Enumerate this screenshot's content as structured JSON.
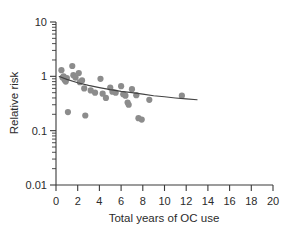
{
  "chart_data": {
    "type": "scatter",
    "title": "",
    "xlabel": "Total years of OC use",
    "ylabel": "Relative risk",
    "xlim": [
      0,
      20
    ],
    "ylim": [
      0.01,
      10
    ],
    "yscale": "log",
    "xscale": "linear",
    "grid": false,
    "legend": null,
    "xticks": [
      0,
      2,
      4,
      6,
      8,
      10,
      12,
      14,
      16,
      18,
      20
    ],
    "xticklabels": [
      "0",
      "2",
      "4",
      "6",
      "8",
      "10",
      "12",
      "14",
      "16",
      "18",
      "20"
    ],
    "yticks": [
      0.01,
      0.1,
      1,
      10
    ],
    "yticklabels": [
      "0.01",
      "0.1",
      "1",
      "10"
    ],
    "yminorticks": [
      0.02,
      0.03,
      0.04,
      0.05,
      0.06,
      0.07,
      0.08,
      0.09,
      0.2,
      0.3,
      0.4,
      0.5,
      0.6,
      0.7,
      0.8,
      0.9,
      2,
      3,
      4,
      5,
      6,
      7,
      8,
      9
    ],
    "marker": "circle",
    "marker_color": "#8c8c8c",
    "marker_size": 3.1,
    "points": [
      {
        "x": 0.5,
        "y": 1.3
      },
      {
        "x": 0.6,
        "y": 0.95
      },
      {
        "x": 0.7,
        "y": 1.0
      },
      {
        "x": 0.8,
        "y": 0.86
      },
      {
        "x": 0.9,
        "y": 0.8
      },
      {
        "x": 1.0,
        "y": 0.93
      },
      {
        "x": 1.1,
        "y": 0.22
      },
      {
        "x": 1.5,
        "y": 1.55
      },
      {
        "x": 1.6,
        "y": 1.05
      },
      {
        "x": 1.8,
        "y": 0.95
      },
      {
        "x": 2.1,
        "y": 1.15
      },
      {
        "x": 2.2,
        "y": 0.78
      },
      {
        "x": 2.4,
        "y": 0.84
      },
      {
        "x": 2.6,
        "y": 0.6
      },
      {
        "x": 2.7,
        "y": 0.19
      },
      {
        "x": 3.2,
        "y": 0.55
      },
      {
        "x": 3.6,
        "y": 0.5
      },
      {
        "x": 4.1,
        "y": 0.9
      },
      {
        "x": 4.3,
        "y": 0.48
      },
      {
        "x": 4.6,
        "y": 0.4
      },
      {
        "x": 5.0,
        "y": 0.62
      },
      {
        "x": 5.2,
        "y": 0.52
      },
      {
        "x": 5.5,
        "y": 0.5
      },
      {
        "x": 6.0,
        "y": 0.66
      },
      {
        "x": 6.2,
        "y": 0.47
      },
      {
        "x": 6.4,
        "y": 0.44
      },
      {
        "x": 6.6,
        "y": 0.33
      },
      {
        "x": 6.7,
        "y": 0.3
      },
      {
        "x": 7.0,
        "y": 0.58
      },
      {
        "x": 7.4,
        "y": 0.45
      },
      {
        "x": 7.6,
        "y": 0.17
      },
      {
        "x": 7.9,
        "y": 0.16
      },
      {
        "x": 8.6,
        "y": 0.37
      },
      {
        "x": 11.6,
        "y": 0.44
      }
    ],
    "fit_curve": {
      "label": "fitted trend",
      "color": "#444444",
      "x": [
        0.3,
        1.0,
        2.0,
        3.0,
        4.0,
        5.0,
        6.0,
        7.0,
        8.0,
        9.0,
        10.0,
        11.0,
        12.0,
        13.0
      ],
      "y": [
        0.99,
        0.88,
        0.76,
        0.68,
        0.62,
        0.57,
        0.53,
        0.5,
        0.47,
        0.44,
        0.42,
        0.4,
        0.385,
        0.37
      ]
    }
  }
}
